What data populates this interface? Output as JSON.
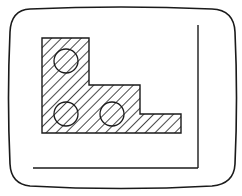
{
  "diagram": {
    "type": "line-drawing",
    "colors": {
      "stroke": "#1a1a1a",
      "background": "#ffffff"
    },
    "screen_frame": {
      "shape": "rounded-bulged-rectangle",
      "path": "M 30 9 Q 121 5 212 9 Q 234 10 235 32 Q 238 98 235 164 Q 234 184 212 186 Q 121 191 30 186 Q 11 184 10 164 Q 7 98 10 32 Q 11 10 30 9 Z"
    },
    "axes": {
      "vertical_line": {
        "x1": 198,
        "y1": 25,
        "x2": 198,
        "y2": 168
      },
      "horizontal_line": {
        "x1": 33,
        "y1": 168,
        "x2": 198,
        "y2": 168
      }
    },
    "hatched_part": {
      "fill_pattern": "diagonal-hatch",
      "outline_points": "42,38 89,38 89,85 140,85 140,114 181,114 181,133 42,133",
      "holes": [
        {
          "cx": 66,
          "cy": 61,
          "r": 12
        },
        {
          "cx": 66,
          "cy": 114,
          "r": 12
        },
        {
          "cx": 112,
          "cy": 114,
          "r": 12
        }
      ]
    }
  }
}
